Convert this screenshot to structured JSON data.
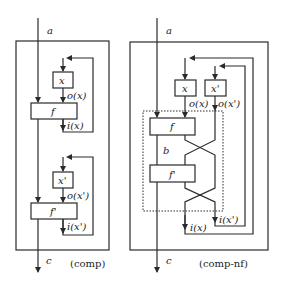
{
  "diagrams": [
    {
      "caption": "(comp)",
      "input_label": "a",
      "output_label": "c",
      "stages": [
        {
          "state_box": "x",
          "function_box": "f",
          "out_label": "o(x)",
          "in_label": "i(x)"
        },
        {
          "state_box": "x'",
          "function_box": "f'",
          "out_label": "o(x')",
          "in_label": "i(x')"
        }
      ]
    },
    {
      "caption": "(comp-nf)",
      "input_label": "a",
      "output_label": "c",
      "intermediate_label": "b",
      "state_boxes": [
        "x",
        "x'"
      ],
      "function_boxes": [
        "f",
        "f'"
      ],
      "out_labels": [
        "o(x)",
        "o(x')"
      ],
      "in_labels": [
        "i(x)",
        "i(x')"
      ]
    }
  ],
  "colors": {
    "stroke": "#2a2a2a",
    "background": "#ffffff"
  }
}
